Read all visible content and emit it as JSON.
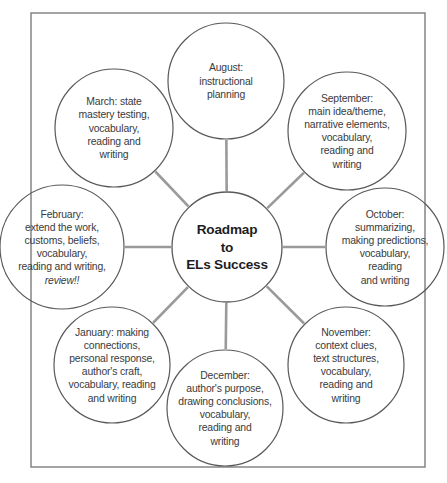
{
  "diagram": {
    "type": "radial-hub-and-spoke",
    "frame": {
      "stroke_color": "#7d7d7d"
    },
    "colors": {
      "circle_stroke": "#59595b",
      "spoke": "#9a9a9a",
      "text": "#3a3a3c",
      "center_text": "#1d1d1f",
      "background": "#ffffff"
    },
    "center": {
      "name": "Roadmap to ELs Success",
      "lines": [
        "Roadmap",
        "to",
        "ELs Success"
      ],
      "cx": 227,
      "cy": 247,
      "r": 55
    },
    "nodes": [
      {
        "id": "august",
        "month": "August",
        "text": "August: instructional planning",
        "lines": [
          "August:",
          "instructional",
          "planning"
        ],
        "cx": 226,
        "cy": 81,
        "r": 58,
        "angle_deg": 90
      },
      {
        "id": "september",
        "month": "September",
        "text": "September: main idea/theme, narrative elements, vocabulary, reading and writing",
        "lines": [
          "September:",
          "main idea/theme,",
          "narrative elements,",
          "vocabulary,",
          "reading and",
          "writing"
        ],
        "cx": 347,
        "cy": 131,
        "r": 59,
        "angle_deg": 45
      },
      {
        "id": "october",
        "month": "October",
        "text": "October: summarizing, making predictions, vocabulary, reading and writing",
        "lines": [
          "October:",
          "summarizing,",
          "making predictions,",
          "vocabulary,",
          "reading",
          "and writing"
        ],
        "cx": 385,
        "cy": 247,
        "r": 59,
        "angle_deg": 0
      },
      {
        "id": "november",
        "month": "November",
        "text": "November: context clues, text structures, vocabulary, reading and writing",
        "lines": [
          "November:",
          "context clues,",
          "text structures,",
          "vocabulary,",
          "reading and",
          "writing"
        ],
        "cx": 346,
        "cy": 365,
        "r": 58,
        "angle_deg": -45
      },
      {
        "id": "december",
        "month": "December",
        "text": "December: author's purpose, drawing conclusions, vocabulary, reading and writing",
        "lines": [
          "December:",
          "author's purpose,",
          "drawing conclusions,",
          "vocabulary,",
          "reading and",
          "writing"
        ],
        "cx": 225,
        "cy": 408,
        "r": 58,
        "angle_deg": -90
      },
      {
        "id": "january",
        "month": "January",
        "text": "January: making connections, personal response, author's craft, vocabulary, reading and writing",
        "lines": [
          "January: making",
          "connections,",
          "personal response,",
          "author's craft,",
          "vocabulary, reading",
          "and writing"
        ],
        "cx": 112,
        "cy": 365,
        "r": 58,
        "angle_deg": -135
      },
      {
        "id": "february",
        "month": "February",
        "text": "February: extend the work, customs, beliefs, vocabulary, reading and writing, review!!",
        "lines": [
          "February:",
          "extend the work,",
          "customs, beliefs,",
          "vocabulary,",
          "reading and writing,",
          "review!!"
        ],
        "italic_last_line": true,
        "cx": 62,
        "cy": 247,
        "r": 62,
        "angle_deg": 180
      },
      {
        "id": "march",
        "month": "March",
        "text": "March: state mastery testing, vocabulary, reading and writing",
        "lines": [
          "March: state",
          "mastery testing,",
          "vocabulary,",
          "reading and",
          "writing"
        ],
        "cx": 114,
        "cy": 128,
        "r": 59,
        "angle_deg": 135
      }
    ]
  }
}
